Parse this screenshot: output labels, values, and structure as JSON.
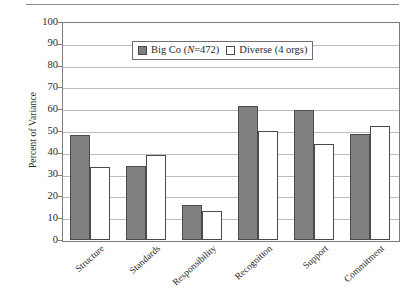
{
  "chart_data": {
    "type": "bar",
    "title": "",
    "xlabel": "",
    "ylabel": "Percent of Variance",
    "ylim": [
      0,
      100
    ],
    "ytick_step": 10,
    "grid": true,
    "legend_position": "top-center-inside",
    "categories": [
      "Structure",
      "Standards",
      "Responsibility",
      "Recognition",
      "Support",
      "Commitment"
    ],
    "series": [
      {
        "name": "Big Co (N=472)",
        "name_prefix": "Big Co (",
        "name_italic": "N",
        "name_suffix": "=472)",
        "color": "#808080",
        "values": [
          48,
          34,
          16,
          61.5,
          59.5,
          48.5
        ]
      },
      {
        "name": "Diverse (4 orgs)",
        "color": "#ffffff",
        "values": [
          33.5,
          39,
          13.5,
          50,
          44,
          52.5
        ]
      }
    ],
    "yticks": [
      "0",
      "10",
      "20",
      "30",
      "40",
      "50",
      "60",
      "70",
      "80",
      "90",
      "100"
    ]
  },
  "colors": {
    "series_a": "#808080",
    "series_b": "#ffffff",
    "bar_outline": "#4a4a4a",
    "grid": "#bcbcbc",
    "axis": "#7d7d7d",
    "text": "#2b2b2b"
  }
}
